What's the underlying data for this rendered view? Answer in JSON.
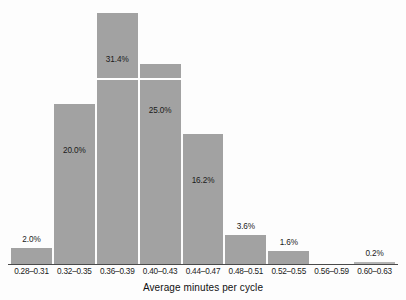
{
  "chart_data": {
    "type": "bar",
    "title": "",
    "subtitle": "",
    "xlabel": "Average minutes per cycle",
    "ylabel": "",
    "categories": [
      "0.28–0.31",
      "0.32–0.35",
      "0.36–0.39",
      "0.40–0.43",
      "0.44–0.47",
      "0.48–0.51",
      "0.52–0.55",
      "0.56–0.59",
      "0.60–0.63"
    ],
    "values": [
      2.0,
      20.0,
      31.4,
      25.0,
      16.2,
      3.6,
      1.6,
      0.0,
      0.2
    ],
    "data_labels": [
      "2.0%",
      "20.0%",
      "31.4%",
      "25.0%",
      "16.2%",
      "3.6%",
      "1.6%",
      "",
      "0.2%"
    ],
    "ylim": [
      0,
      32.5
    ],
    "grid": false,
    "legend": "none",
    "bar_color": "#a2a2a2",
    "axis_color": "#4a4a4a",
    "text_color": "#1a1a1a",
    "background_color": "#fdfdfd"
  }
}
